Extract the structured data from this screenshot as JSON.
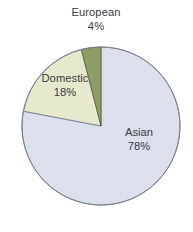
{
  "chart_data": {
    "type": "pie",
    "title": "",
    "subtitle": "",
    "xlabel": "",
    "ylabel": "",
    "grid": false,
    "legend_position": "none",
    "labels_position": "inside-and-outside",
    "total": 100,
    "unit": "%",
    "start_angle_deg": 0,
    "direction": "clockwise",
    "categories": [
      "Asian",
      "Domestic",
      "European"
    ],
    "values": [
      78,
      18,
      4
    ],
    "slices": [
      {
        "name": "Asian",
        "value": 78,
        "value_label": "78%",
        "color": "#dcdfec",
        "stroke": "#7b8090",
        "start_deg": 0,
        "end_deg": 280.8,
        "label_placement": "inside"
      },
      {
        "name": "Domestic",
        "value": 18,
        "value_label": "18%",
        "color": "#e6e9cb",
        "stroke": "#7b8090",
        "start_deg": 280.8,
        "end_deg": 345.6,
        "label_placement": "inside"
      },
      {
        "name": "European",
        "value": 4,
        "value_label": "4%",
        "color": "#8e9c66",
        "stroke": "#5e6743",
        "start_deg": 345.6,
        "end_deg": 360,
        "label_placement": "outside-top"
      }
    ],
    "geometry": {
      "center_x": 101,
      "center_y": 126,
      "radius": 79
    },
    "colors": {
      "background": "#ffffff",
      "text": "#3b3b3f",
      "outline": "#7b8090",
      "asian": "#dcdfec",
      "domestic": "#e6e9cb",
      "european": "#8e9c66"
    }
  }
}
